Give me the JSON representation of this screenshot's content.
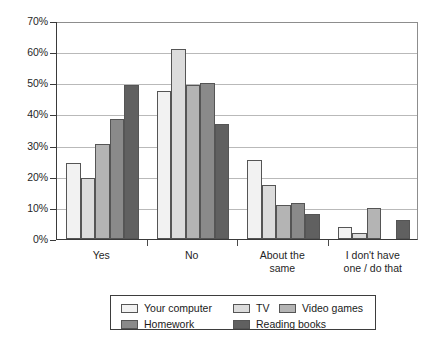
{
  "chart_data": {
    "type": "bar",
    "title": "",
    "subtitle": "",
    "xlabel": "",
    "ylabel": "",
    "ylim": [
      0,
      70
    ],
    "ytick_labels": [
      "0%",
      "10%",
      "20%",
      "30%",
      "40%",
      "50%",
      "60%",
      "70%"
    ],
    "ytick_values": [
      0,
      10,
      20,
      30,
      40,
      50,
      60,
      70
    ],
    "grid": true,
    "legend_position": "bottom",
    "categories": [
      "Yes",
      "No",
      "About the\nsame",
      "I don't have\none / do that"
    ],
    "category_labels": [
      {
        "line1": "Yes",
        "line2": ""
      },
      {
        "line1": "No",
        "line2": ""
      },
      {
        "line1": "About the",
        "line2": "same"
      },
      {
        "line1": "I don't have",
        "line2": "one / do that"
      }
    ],
    "series": [
      {
        "name": "Your computer",
        "color": "#f2f2f2",
        "values": [
          24.5,
          47.5,
          25.5,
          4.0
        ]
      },
      {
        "name": "TV",
        "color": "#dcdcdc",
        "values": [
          19.5,
          61.0,
          17.5,
          2.0
        ]
      },
      {
        "name": "Video games",
        "color": "#b4b4b4",
        "values": [
          30.5,
          49.5,
          11.0,
          10.0
        ]
      },
      {
        "name": "Homework",
        "color": "#8a8a8a",
        "values": [
          38.5,
          50.0,
          11.5,
          0.0
        ]
      },
      {
        "name": "Reading books",
        "color": "#606060",
        "values": [
          49.5,
          37.0,
          8.0,
          6.0
        ]
      }
    ]
  },
  "legend": {
    "items": [
      {
        "label": "Your computer",
        "color": "#f2f2f2"
      },
      {
        "label": "TV",
        "color": "#dcdcdc"
      },
      {
        "label": "Video games",
        "color": "#b4b4b4"
      },
      {
        "label": "Homework",
        "color": "#8a8a8a"
      },
      {
        "label": "Reading books",
        "color": "#606060"
      }
    ]
  },
  "colors": {
    "axis": "#3a3a3a",
    "grid": "#b9b9b9",
    "bar_outline": "#555555",
    "background": "#ffffff",
    "text": "#1a1a1a"
  }
}
